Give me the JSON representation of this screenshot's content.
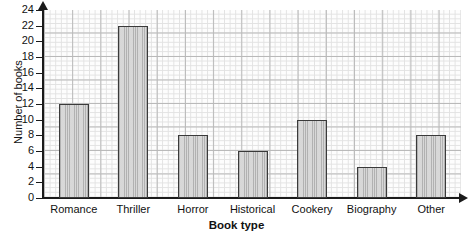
{
  "chart_data": {
    "type": "bar",
    "title": "",
    "xlabel": "Book type",
    "ylabel": "Number of books",
    "categories": [
      "Romance",
      "Thriller",
      "Horror",
      "Historical",
      "Cookery",
      "Biography",
      "Other"
    ],
    "values": [
      12,
      22,
      8,
      6,
      10,
      4,
      8
    ],
    "ylim": [
      0,
      24
    ],
    "ytick_step": 2,
    "ytick_labels": [
      "0",
      "2",
      "4",
      "6",
      "8",
      "10",
      "12",
      "14",
      "16",
      "18",
      "20",
      "22",
      "24"
    ],
    "grid": true,
    "grid_style": "graph-paper",
    "legend": false,
    "bar_fill_color": "#d2d2d2",
    "bar_edge_color": "#3a3a3a",
    "axis_color": "#1a1a1a",
    "background_color": "#ffffff"
  }
}
